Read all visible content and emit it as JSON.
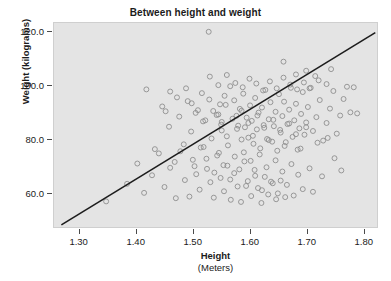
{
  "figure": {
    "top_strip_text": "",
    "background_color": "#ffffff",
    "plot_background_color": "#e4e4e4",
    "plot_border_color": "#cfcfcf"
  },
  "chart_data": {
    "type": "scatter",
    "title": "Between height and weight",
    "xlabel": "Height",
    "xlabel_units": "(Meters)",
    "ylabel": "Weight (kilograms)",
    "xlim": [
      1.255,
      1.825
    ],
    "ylim": [
      47.0,
      123.5
    ],
    "xticks": [
      1.3,
      1.4,
      1.5,
      1.6,
      1.7,
      1.8
    ],
    "xtick_labels": [
      "1.30",
      "1.40",
      "1.50",
      "1.60",
      "1.70",
      "1.80"
    ],
    "yticks": [
      60.0,
      80.0,
      100.0,
      120.0
    ],
    "ytick_labels": [
      "60.0",
      "80.0",
      "100.0",
      "120.0"
    ],
    "grid": false,
    "legend": null,
    "marker": {
      "shape": "circle-open",
      "size_px": 5,
      "edge_color": "#8d8d8d",
      "fill": "none"
    },
    "fit_line": {
      "type": "linear-regression",
      "color": "#1d1d1d",
      "width_px": 1.6,
      "x_start": 1.268,
      "y_start": 47.8,
      "x_end": 1.822,
      "y_end": 119.9
    },
    "points": [
      [
        1.528,
        120.2
      ],
      [
        1.347,
        56.6
      ],
      [
        1.452,
        90.4
      ],
      [
        1.505,
        89.8
      ],
      [
        1.522,
        87.0
      ],
      [
        1.536,
        90.5
      ],
      [
        1.545,
        89.2
      ],
      [
        1.548,
        93.0
      ],
      [
        1.551,
        86.4
      ],
      [
        1.551,
        83.2
      ],
      [
        1.556,
        96.2
      ],
      [
        1.56,
        81.0
      ],
      [
        1.566,
        99.8
      ],
      [
        1.573,
        94.5
      ],
      [
        1.577,
        88.7
      ],
      [
        1.58,
        85.0
      ],
      [
        1.583,
        91.3
      ],
      [
        1.586,
        79.8
      ],
      [
        1.589,
        97.0
      ],
      [
        1.592,
        84.4
      ],
      [
        1.595,
        88.0
      ],
      [
        1.598,
        80.5
      ],
      [
        1.601,
        92.6
      ],
      [
        1.604,
        86.8
      ],
      [
        1.607,
        78.2
      ],
      [
        1.61,
        95.4
      ],
      [
        1.613,
        83.6
      ],
      [
        1.616,
        89.9
      ],
      [
        1.619,
        76.5
      ],
      [
        1.622,
        91.8
      ],
      [
        1.625,
        85.2
      ],
      [
        1.628,
        98.4
      ],
      [
        1.631,
        80.0
      ],
      [
        1.634,
        87.4
      ],
      [
        1.637,
        93.8
      ],
      [
        1.64,
        79.0
      ],
      [
        1.643,
        84.8
      ],
      [
        1.646,
        90.2
      ],
      [
        1.649,
        75.6
      ],
      [
        1.652,
        96.8
      ],
      [
        1.655,
        82.4
      ],
      [
        1.658,
        88.6
      ],
      [
        1.661,
        94.0
      ],
      [
        1.664,
        78.8
      ],
      [
        1.667,
        85.6
      ],
      [
        1.67,
        91.0
      ],
      [
        1.673,
        99.2
      ],
      [
        1.676,
        80.8
      ],
      [
        1.679,
        87.0
      ],
      [
        1.682,
        93.2
      ],
      [
        1.685,
        76.0
      ],
      [
        1.688,
        84.0
      ],
      [
        1.691,
        89.4
      ],
      [
        1.694,
        97.6
      ],
      [
        1.697,
        81.6
      ],
      [
        1.7,
        86.2
      ],
      [
        1.703,
        92.0
      ],
      [
        1.706,
        99.0
      ],
      [
        1.712,
        83.0
      ],
      [
        1.718,
        88.2
      ],
      [
        1.724,
        94.6
      ],
      [
        1.73,
        79.4
      ],
      [
        1.736,
        86.0
      ],
      [
        1.742,
        91.4
      ],
      [
        1.748,
        98.0
      ],
      [
        1.754,
        82.0
      ],
      [
        1.76,
        88.8
      ],
      [
        1.766,
        95.0
      ],
      [
        1.772,
        99.6
      ],
      [
        1.778,
        90.0
      ],
      [
        1.784,
        99.4
      ],
      [
        1.79,
        89.6
      ],
      [
        1.418,
        98.6
      ],
      [
        1.433,
        76.2
      ],
      [
        1.446,
        92.2
      ],
      [
        1.458,
        84.6
      ],
      [
        1.468,
        71.4
      ],
      [
        1.476,
        88.4
      ],
      [
        1.484,
        78.0
      ],
      [
        1.491,
        94.2
      ],
      [
        1.497,
        82.8
      ],
      [
        1.503,
        69.8
      ],
      [
        1.509,
        90.8
      ],
      [
        1.514,
        76.8
      ],
      [
        1.518,
        86.6
      ],
      [
        1.524,
        72.6
      ],
      [
        1.529,
        94.8
      ],
      [
        1.533,
        80.2
      ],
      [
        1.538,
        67.4
      ],
      [
        1.542,
        89.0
      ],
      [
        1.546,
        74.8
      ],
      [
        1.55,
        85.4
      ],
      [
        1.554,
        70.2
      ],
      [
        1.558,
        92.8
      ],
      [
        1.562,
        77.6
      ],
      [
        1.566,
        64.8
      ],
      [
        1.57,
        87.6
      ],
      [
        1.574,
        73.4
      ],
      [
        1.578,
        83.8
      ],
      [
        1.582,
        68.6
      ],
      [
        1.586,
        90.6
      ],
      [
        1.59,
        75.0
      ],
      [
        1.594,
        62.4
      ],
      [
        1.598,
        86.0
      ],
      [
        1.602,
        71.8
      ],
      [
        1.606,
        81.2
      ],
      [
        1.61,
        66.2
      ],
      [
        1.614,
        88.8
      ],
      [
        1.618,
        74.2
      ],
      [
        1.622,
        60.8
      ],
      [
        1.626,
        84.2
      ],
      [
        1.63,
        69.4
      ],
      [
        1.634,
        79.6
      ],
      [
        1.638,
        64.0
      ],
      [
        1.642,
        87.2
      ],
      [
        1.646,
        72.0
      ],
      [
        1.65,
        59.6
      ],
      [
        1.654,
        83.4
      ],
      [
        1.658,
        67.8
      ],
      [
        1.662,
        77.4
      ],
      [
        1.666,
        62.8
      ],
      [
        1.67,
        85.8
      ],
      [
        1.674,
        70.6
      ],
      [
        1.678,
        58.8
      ],
      [
        1.682,
        81.8
      ],
      [
        1.686,
        66.6
      ],
      [
        1.69,
        76.4
      ],
      [
        1.694,
        61.2
      ],
      [
        1.7,
        84.4
      ],
      [
        1.706,
        69.0
      ],
      [
        1.712,
        60.2
      ],
      [
        1.72,
        78.6
      ],
      [
        1.728,
        66.0
      ],
      [
        1.738,
        80.4
      ],
      [
        1.75,
        72.8
      ],
      [
        1.762,
        68.2
      ],
      [
        1.384,
        63.2
      ],
      [
        1.402,
        70.8
      ],
      [
        1.414,
        59.8
      ],
      [
        1.428,
        66.4
      ],
      [
        1.44,
        74.6
      ],
      [
        1.45,
        62.0
      ],
      [
        1.46,
        69.2
      ],
      [
        1.47,
        57.8
      ],
      [
        1.478,
        75.4
      ],
      [
        1.486,
        64.6
      ],
      [
        1.494,
        58.4
      ],
      [
        1.5,
        72.2
      ],
      [
        1.506,
        66.8
      ],
      [
        1.512,
        61.0
      ],
      [
        1.519,
        77.0
      ],
      [
        1.525,
        68.8
      ],
      [
        1.531,
        63.8
      ],
      [
        1.537,
        58.0
      ],
      [
        1.543,
        73.8
      ],
      [
        1.549,
        65.4
      ],
      [
        1.555,
        60.4
      ],
      [
        1.561,
        70.0
      ],
      [
        1.567,
        57.2
      ],
      [
        1.573,
        67.2
      ],
      [
        1.579,
        62.2
      ],
      [
        1.585,
        56.4
      ],
      [
        1.591,
        71.6
      ],
      [
        1.597,
        64.2
      ],
      [
        1.603,
        58.6
      ],
      [
        1.609,
        68.4
      ],
      [
        1.615,
        61.6
      ],
      [
        1.621,
        56.0
      ],
      [
        1.627,
        65.8
      ],
      [
        1.633,
        59.2
      ],
      [
        1.641,
        63.4
      ],
      [
        1.647,
        57.4
      ],
      [
        1.655,
        64.4
      ],
      [
        1.663,
        58.2
      ],
      [
        1.53,
        103.4
      ],
      [
        1.545,
        100.2
      ],
      [
        1.56,
        104.0
      ],
      [
        1.575,
        101.0
      ],
      [
        1.588,
        99.4
      ],
      [
        1.6,
        102.6
      ],
      [
        1.612,
        100.8
      ],
      [
        1.624,
        98.2
      ],
      [
        1.636,
        101.6
      ],
      [
        1.648,
        99.0
      ],
      [
        1.66,
        103.0
      ],
      [
        1.672,
        100.4
      ],
      [
        1.684,
        98.6
      ],
      [
        1.696,
        101.2
      ],
      [
        1.708,
        99.2
      ],
      [
        1.722,
        102.0
      ],
      [
        1.736,
        100.6
      ],
      [
        1.46,
        97.8
      ],
      [
        1.472,
        95.6
      ],
      [
        1.488,
        99.0
      ],
      [
        1.498,
        93.4
      ],
      [
        1.516,
        97.2
      ],
      [
        1.682,
        104.2
      ],
      [
        1.7,
        105.6
      ],
      [
        1.716,
        103.6
      ],
      [
        1.744,
        106.2
      ],
      [
        1.66,
        109.0
      ]
    ]
  }
}
